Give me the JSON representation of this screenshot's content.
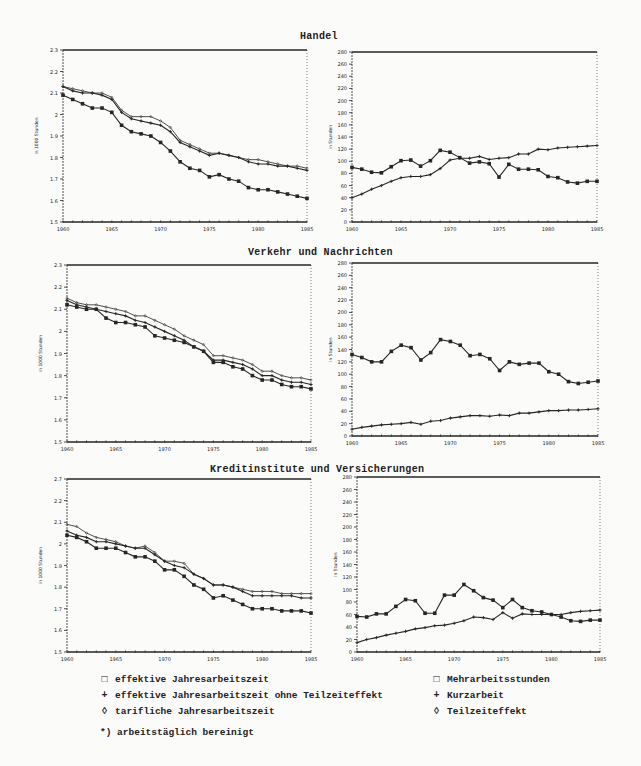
{
  "sections": [
    {
      "title": "Handel"
    },
    {
      "title": "Verkehr und Nachrichten"
    },
    {
      "title": "Kreditinstitute und Versicherungen"
    }
  ],
  "legend": {
    "left": [
      {
        "symbol": "square",
        "glyph": "□",
        "label": "effektive Jahresarbeitszeit"
      },
      {
        "symbol": "plus",
        "glyph": "+",
        "label": "effektive Jahresarbeitszeit ohne Teilzeiteffekt"
      },
      {
        "symbol": "diamond",
        "glyph": "◊",
        "label": "tarifliche Jahresarbeitszeit"
      }
    ],
    "right": [
      {
        "symbol": "square",
        "glyph": "□",
        "label": "Mehrarbeitsstunden"
      },
      {
        "symbol": "plus",
        "glyph": "+",
        "label": "Kurzarbeit"
      },
      {
        "symbol": "diamond",
        "glyph": "◊",
        "label": "Teilzeiteffekt"
      }
    ],
    "footnote": "*) arbeitstäglich bereinigt"
  },
  "chart_data": [
    {
      "type": "line",
      "section": "Handel",
      "panel": "left",
      "ylabel": "in 1000 Stunden",
      "xlabel": "",
      "x_ticks": [
        "1960",
        "1965",
        "1970",
        "1975",
        "1980",
        "1985"
      ],
      "y_ticks": [
        "1.5",
        "1.6",
        "1.7",
        "1.8",
        "1.9",
        "2",
        "2.1",
        "2.2",
        "2.3"
      ],
      "ylim": [
        1.5,
        2.3
      ],
      "xlim": [
        1960,
        1985
      ],
      "grid": false,
      "x": [
        1960,
        1961,
        1962,
        1963,
        1964,
        1965,
        1966,
        1967,
        1968,
        1969,
        1970,
        1971,
        1972,
        1973,
        1974,
        1975,
        1976,
        1977,
        1978,
        1979,
        1980,
        1981,
        1982,
        1983,
        1984,
        1985
      ],
      "series": [
        {
          "name": "tarifliche Jahresarbeitszeit",
          "marker": "diamond",
          "values": [
            2.13,
            2.12,
            2.11,
            2.1,
            2.1,
            2.08,
            2.02,
            1.99,
            1.99,
            1.99,
            1.97,
            1.94,
            1.88,
            1.86,
            1.84,
            1.82,
            1.82,
            1.81,
            1.8,
            1.79,
            1.79,
            1.78,
            1.77,
            1.76,
            1.76,
            1.75
          ]
        },
        {
          "name": "effektive Jahresarbeitszeit ohne Teilzeiteffekt",
          "marker": "plus",
          "values": [
            2.13,
            2.11,
            2.1,
            2.1,
            2.09,
            2.07,
            2.01,
            1.98,
            1.97,
            1.96,
            1.95,
            1.92,
            1.87,
            1.85,
            1.83,
            1.81,
            1.82,
            1.81,
            1.8,
            1.78,
            1.77,
            1.77,
            1.76,
            1.76,
            1.75,
            1.74
          ]
        },
        {
          "name": "effektive Jahresarbeitszeit",
          "marker": "square",
          "values": [
            2.09,
            2.07,
            2.05,
            2.03,
            2.03,
            2.01,
            1.95,
            1.92,
            1.91,
            1.9,
            1.87,
            1.83,
            1.78,
            1.75,
            1.74,
            1.71,
            1.72,
            1.7,
            1.69,
            1.66,
            1.65,
            1.65,
            1.64,
            1.63,
            1.62,
            1.61
          ]
        }
      ]
    },
    {
      "type": "line",
      "section": "Handel",
      "panel": "right",
      "ylabel": "in Stunden",
      "xlabel": "",
      "x_ticks": [
        "1960",
        "1965",
        "1970",
        "1975",
        "1980",
        "1985"
      ],
      "y_ticks": [
        "0",
        "20",
        "40",
        "60",
        "80",
        "100",
        "120",
        "140",
        "160",
        "180",
        "200",
        "220",
        "240",
        "260",
        "280"
      ],
      "ylim": [
        0,
        280
      ],
      "xlim": [
        1960,
        1985
      ],
      "grid": false,
      "x": [
        1960,
        1961,
        1962,
        1963,
        1964,
        1965,
        1966,
        1967,
        1968,
        1969,
        1970,
        1971,
        1972,
        1973,
        1974,
        1975,
        1976,
        1977,
        1978,
        1979,
        1980,
        1981,
        1982,
        1983,
        1984,
        1985
      ],
      "series": [
        {
          "name": "Mehrarbeitsstunden",
          "marker": "square",
          "values": [
            90,
            87,
            82,
            81,
            91,
            101,
            102,
            92,
            101,
            118,
            115,
            106,
            97,
            99,
            96,
            74,
            95,
            87,
            87,
            86,
            75,
            73,
            66,
            64,
            67,
            67
          ]
        },
        {
          "name": "Teilzeiteffekt",
          "marker": "plus",
          "values": [
            40,
            46,
            54,
            60,
            67,
            73,
            75,
            75,
            78,
            88,
            102,
            105,
            105,
            108,
            103,
            105,
            106,
            112,
            112,
            120,
            119,
            122,
            123,
            124,
            125,
            126
          ]
        }
      ]
    },
    {
      "type": "line",
      "section": "Verkehr und Nachrichten",
      "panel": "left",
      "ylabel": "in 1000 Stunden",
      "xlabel": "",
      "x_ticks": [
        "1960",
        "1965",
        "1970",
        "1975",
        "1980",
        "1985"
      ],
      "y_ticks": [
        "1.5",
        "1.6",
        "1.7",
        "1.8",
        "1.9",
        "2",
        "2.1",
        "2.2",
        "2.3"
      ],
      "ylim": [
        1.5,
        2.3
      ],
      "xlim": [
        1960,
        1985
      ],
      "grid": false,
      "x": [
        1960,
        1961,
        1962,
        1963,
        1964,
        1965,
        1966,
        1967,
        1968,
        1969,
        1970,
        1971,
        1972,
        1973,
        1974,
        1975,
        1976,
        1977,
        1978,
        1979,
        1980,
        1981,
        1982,
        1983,
        1984,
        1985
      ],
      "series": [
        {
          "name": "tarifliche Jahresarbeitszeit",
          "marker": "diamond",
          "values": [
            2.15,
            2.13,
            2.12,
            2.12,
            2.11,
            2.1,
            2.09,
            2.07,
            2.07,
            2.05,
            2.03,
            2.01,
            1.98,
            1.96,
            1.94,
            1.89,
            1.89,
            1.88,
            1.87,
            1.85,
            1.82,
            1.82,
            1.8,
            1.79,
            1.79,
            1.78
          ]
        },
        {
          "name": "effektive Jahresarbeitszeit ohne Teilzeiteffekt",
          "marker": "plus",
          "values": [
            2.14,
            2.12,
            2.11,
            2.1,
            2.09,
            2.08,
            2.07,
            2.05,
            2.04,
            2.02,
            2.0,
            1.98,
            1.96,
            1.93,
            1.91,
            1.87,
            1.87,
            1.86,
            1.85,
            1.83,
            1.8,
            1.8,
            1.78,
            1.77,
            1.77,
            1.76
          ]
        },
        {
          "name": "effektive Jahresarbeitszeit",
          "marker": "square",
          "values": [
            2.12,
            2.11,
            2.1,
            2.1,
            2.06,
            2.04,
            2.04,
            2.03,
            2.02,
            1.98,
            1.97,
            1.96,
            1.95,
            1.93,
            1.91,
            1.86,
            1.86,
            1.84,
            1.83,
            1.8,
            1.78,
            1.78,
            1.76,
            1.75,
            1.75,
            1.74
          ]
        }
      ]
    },
    {
      "type": "line",
      "section": "Verkehr und Nachrichten",
      "panel": "right",
      "ylabel": "in Stunden",
      "xlabel": "",
      "x_ticks": [
        "1960",
        "1965",
        "1970",
        "1975",
        "1980",
        "1985"
      ],
      "y_ticks": [
        "0",
        "20",
        "40",
        "60",
        "80",
        "100",
        "120",
        "140",
        "160",
        "180",
        "200",
        "220",
        "240",
        "260",
        "280"
      ],
      "ylim": [
        0,
        280
      ],
      "xlim": [
        1960,
        1985
      ],
      "grid": false,
      "x": [
        1960,
        1961,
        1962,
        1963,
        1964,
        1965,
        1966,
        1967,
        1968,
        1969,
        1970,
        1971,
        1972,
        1973,
        1974,
        1975,
        1976,
        1977,
        1978,
        1979,
        1980,
        1981,
        1982,
        1983,
        1984,
        1985
      ],
      "series": [
        {
          "name": "Mehrarbeitsstunden",
          "marker": "square",
          "values": [
            132,
            127,
            120,
            120,
            137,
            147,
            143,
            123,
            135,
            156,
            153,
            147,
            130,
            132,
            125,
            106,
            120,
            116,
            118,
            118,
            104,
            100,
            88,
            85,
            87,
            89
          ]
        },
        {
          "name": "Teilzeiteffekt",
          "marker": "plus",
          "values": [
            11,
            14,
            16,
            18,
            19,
            20,
            22,
            19,
            24,
            25,
            29,
            31,
            33,
            33,
            32,
            34,
            33,
            37,
            37,
            39,
            41,
            41,
            42,
            42,
            43,
            44
          ]
        }
      ]
    },
    {
      "type": "line",
      "section": "Kreditinstitute und Versicherungen",
      "panel": "left",
      "ylabel": "in 1000 Stunden",
      "xlabel": "",
      "x_ticks": [
        "1960",
        "1965",
        "1970",
        "1975",
        "1980",
        "1985"
      ],
      "y_ticks": [
        "1.5",
        "1.6",
        "1.7",
        "1.8",
        "1.9",
        "2",
        "2.1",
        "2.2",
        "2.7"
      ],
      "ylim": [
        1.5,
        2.3
      ],
      "xlim": [
        1960,
        1985
      ],
      "grid": false,
      "x": [
        1960,
        1961,
        1962,
        1963,
        1964,
        1965,
        1966,
        1967,
        1968,
        1969,
        1970,
        1971,
        1972,
        1973,
        1974,
        1975,
        1976,
        1977,
        1978,
        1979,
        1980,
        1981,
        1982,
        1983,
        1984,
        1985
      ],
      "series": [
        {
          "name": "tarifliche Jahresarbeitszeit",
          "marker": "diamond",
          "values": [
            2.09,
            2.08,
            2.05,
            2.03,
            2.02,
            2.01,
            1.99,
            1.98,
            1.99,
            1.96,
            1.92,
            1.92,
            1.91,
            1.86,
            1.84,
            1.81,
            1.81,
            1.8,
            1.79,
            1.78,
            1.78,
            1.78,
            1.77,
            1.77,
            1.77,
            1.77
          ]
        },
        {
          "name": "effektive Jahresarbeitszeit ohne Teilzeiteffekt",
          "marker": "plus",
          "values": [
            2.06,
            2.04,
            2.03,
            2.01,
            2.01,
            2.0,
            1.99,
            1.98,
            1.98,
            1.95,
            1.92,
            1.9,
            1.89,
            1.86,
            1.84,
            1.81,
            1.81,
            1.8,
            1.78,
            1.76,
            1.76,
            1.76,
            1.76,
            1.76,
            1.75,
            1.75
          ]
        },
        {
          "name": "effektive Jahresarbeitszeit",
          "marker": "square",
          "values": [
            2.04,
            2.03,
            2.01,
            1.98,
            1.98,
            1.98,
            1.96,
            1.94,
            1.94,
            1.92,
            1.88,
            1.88,
            1.85,
            1.81,
            1.79,
            1.75,
            1.76,
            1.74,
            1.72,
            1.7,
            1.7,
            1.7,
            1.69,
            1.69,
            1.69,
            1.68
          ]
        }
      ]
    },
    {
      "type": "line",
      "section": "Kreditinstitute und Versicherungen",
      "panel": "right",
      "ylabel": "in Stunden",
      "xlabel": "",
      "x_ticks": [
        "1960",
        "1965",
        "1970",
        "1975",
        "1980",
        "1985"
      ],
      "y_ticks": [
        "0",
        "20",
        "40",
        "60",
        "80",
        "100",
        "120",
        "140",
        "160",
        "180",
        "200",
        "220",
        "240",
        "260",
        "280"
      ],
      "ylim": [
        0,
        280
      ],
      "xlim": [
        1960,
        1985
      ],
      "grid": false,
      "x": [
        1960,
        1961,
        1962,
        1963,
        1964,
        1965,
        1966,
        1967,
        1968,
        1969,
        1970,
        1971,
        1972,
        1973,
        1974,
        1975,
        1976,
        1977,
        1978,
        1979,
        1980,
        1981,
        1982,
        1983,
        1984,
        1985
      ],
      "series": [
        {
          "name": "Mehrarbeitsstunden",
          "marker": "square",
          "values": [
            57,
            56,
            61,
            61,
            73,
            84,
            82,
            62,
            62,
            91,
            91,
            108,
            98,
            87,
            83,
            71,
            84,
            71,
            66,
            64,
            60,
            56,
            50,
            49,
            51,
            51
          ]
        },
        {
          "name": "Teilzeiteffekt",
          "marker": "plus",
          "values": [
            15,
            20,
            23,
            27,
            30,
            33,
            37,
            39,
            42,
            43,
            46,
            50,
            56,
            55,
            52,
            63,
            54,
            61,
            60,
            60,
            60,
            60,
            63,
            65,
            66,
            67
          ]
        }
      ]
    }
  ]
}
